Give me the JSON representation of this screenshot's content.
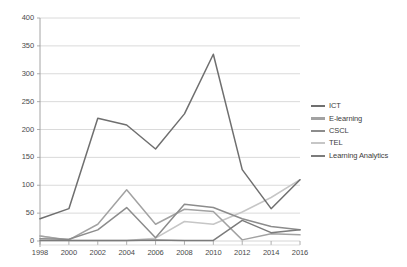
{
  "chart_data": {
    "type": "line",
    "title": "",
    "subtitle": "",
    "xlabel": "",
    "ylabel": "",
    "x": [
      1998,
      2000,
      2002,
      2004,
      2006,
      2008,
      2010,
      2012,
      2014,
      2016
    ],
    "xtick_labels": [
      "1998",
      "2000",
      "2002",
      "2004",
      "2006",
      "2008",
      "2010",
      "2012",
      "2014",
      "2016"
    ],
    "ytick_labels": [
      "0",
      "50",
      "100",
      "150",
      "200",
      "250",
      "300",
      "350",
      "400"
    ],
    "yticks": [
      0,
      50,
      100,
      150,
      200,
      250,
      300,
      350,
      400
    ],
    "ylim": [
      0,
      400
    ],
    "xlim": [
      1998,
      2016
    ],
    "grid": "horizontal",
    "legend_position": "right",
    "series": [
      {
        "name": "ICT",
        "color": "#6f6f6f",
        "values": [
          40,
          58,
          220,
          208,
          165,
          228,
          335,
          128,
          58,
          110
        ]
      },
      {
        "name": "E-learning",
        "color": "#a2a2a2",
        "values": [
          9,
          2,
          30,
          92,
          30,
          57,
          53,
          2,
          13,
          11
        ]
      },
      {
        "name": "CSCL",
        "color": "#8c8c8c",
        "values": [
          4,
          3,
          20,
          60,
          6,
          66,
          60,
          40,
          26,
          20
        ]
      },
      {
        "name": "TEL",
        "color": "#c6c6c6",
        "values": [
          9,
          1,
          1,
          1,
          5,
          35,
          30,
          52,
          78,
          110
        ]
      },
      {
        "name": "Learning Analytics",
        "color": "#7b7b7b",
        "values": [
          1,
          1,
          1,
          1,
          2,
          1,
          1,
          37,
          15,
          20
        ]
      }
    ]
  },
  "legend": {
    "items": [
      {
        "label": "ICT"
      },
      {
        "label": "E-learning"
      },
      {
        "label": "CSCL"
      },
      {
        "label": "TEL"
      },
      {
        "label": "Learning Analytics"
      }
    ]
  },
  "axis": {
    "y_labels": [
      "400",
      "350",
      "300",
      "250",
      "200",
      "150",
      "100",
      "50",
      "0"
    ],
    "x_labels": [
      "1998",
      "2000",
      "2002",
      "2004",
      "2006",
      "2008",
      "2010",
      "2012",
      "2014",
      "2016"
    ]
  },
  "colors": {
    "grid": "#d0d0d0",
    "axis": "#9a9a9a",
    "text": "#4a4a4a",
    "background": "#ffffff"
  }
}
